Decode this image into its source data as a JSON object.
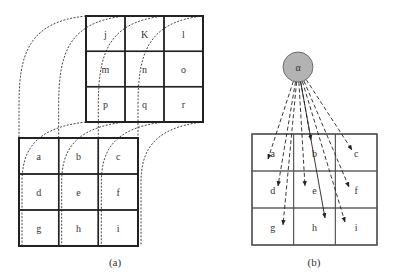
{
  "panel_a": {
    "caption": "(a)",
    "top_grid": {
      "x": 86,
      "y": 16,
      "w": 117,
      "h": 106,
      "cells": [
        "j",
        "K",
        "l",
        "m",
        "n",
        "o",
        "p",
        "q",
        "r"
      ]
    },
    "bottom_grid": {
      "x": 19,
      "y": 138,
      "w": 119,
      "h": 108,
      "cells": [
        "a",
        "b",
        "c",
        "d",
        "e",
        "f",
        "g",
        "h",
        "i"
      ]
    }
  },
  "panel_b": {
    "caption": "(b)",
    "node": {
      "label": "α",
      "cx": 298,
      "cy": 67,
      "r": 15,
      "fill": "#b3b3b3"
    },
    "grid": {
      "x": 252,
      "y": 134,
      "w": 125,
      "h": 111,
      "cells": [
        "a",
        "b",
        "c",
        "d",
        "e",
        "f",
        "g",
        "h",
        "i"
      ]
    },
    "arrows": [
      {
        "to": "a",
        "x": 268,
        "y": 159,
        "style": "dashed"
      },
      {
        "to": "b",
        "x": 311,
        "y": 140,
        "style": "dashed"
      },
      {
        "to": "c",
        "x": 352,
        "y": 150,
        "style": "dashed"
      },
      {
        "to": "d",
        "x": 278,
        "y": 186,
        "style": "dashed"
      },
      {
        "to": "e",
        "x": 305,
        "y": 186,
        "style": "dashed"
      },
      {
        "to": "f",
        "x": 349,
        "y": 187,
        "style": "dashed"
      },
      {
        "to": "g",
        "x": 283,
        "y": 225,
        "style": "dashed"
      },
      {
        "to": "h",
        "x": 325,
        "y": 218,
        "style": "solid"
      },
      {
        "to": "i",
        "x": 345,
        "y": 222,
        "style": "dashed"
      }
    ]
  }
}
